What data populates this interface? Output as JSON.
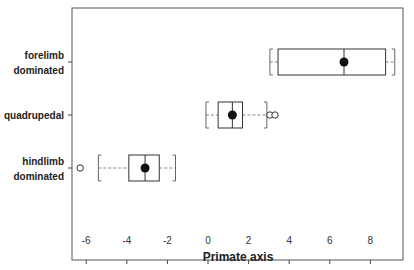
{
  "chart_data": {
    "type": "boxplot",
    "orientation": "horizontal",
    "title": "",
    "xlabel": "Primate axis",
    "ylabel": "",
    "xlim": [
      -6.5,
      9.4
    ],
    "x_ticks": [
      -6,
      -4,
      -2,
      0,
      2,
      4,
      6,
      8
    ],
    "x_tick_labels": [
      "-6",
      "-4",
      "-2",
      "0",
      "2",
      "4",
      "6",
      "8"
    ],
    "grid": false,
    "legend": null,
    "categories": [
      "forelimb dominated",
      "quadrupedal",
      "hindlimb dominated"
    ],
    "series": [
      {
        "name": "forelimb dominated",
        "label_lines": [
          "forelimb",
          "dominated"
        ],
        "whisker_low": 3.05,
        "q1": 3.45,
        "median": 6.7,
        "q3": 8.75,
        "whisker_high": 9.2,
        "mean": 6.7,
        "outliers": []
      },
      {
        "name": "quadrupedal",
        "label_lines": [
          "quadrupedal"
        ],
        "whisker_low": -0.1,
        "q1": 0.5,
        "median": 1.2,
        "q3": 1.7,
        "whisker_high": 2.9,
        "mean": 1.2,
        "outliers": [
          3.05,
          3.3
        ]
      },
      {
        "name": "hindlimb dominated",
        "label_lines": [
          "hindlimb",
          "dominated"
        ],
        "whisker_low": -5.4,
        "q1": -3.9,
        "median": -3.1,
        "q3": -2.4,
        "whisker_high": -1.6,
        "mean": -3.1,
        "outliers": [
          -6.3
        ]
      }
    ],
    "colors": {
      "box": "#333333",
      "whisker": "#888888",
      "mean_dot": "#111111",
      "axis": "#444444"
    }
  }
}
